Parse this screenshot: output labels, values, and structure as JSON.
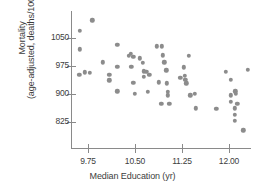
{
  "chart_data": {
    "type": "scatter",
    "title": "",
    "xlabel": "Median Education (yr)",
    "ylabel_line1": "Mortality",
    "ylabel_line2": "(age-adjusted, deaths/100 000)",
    "ylabel": "Mortality (age-adjusted, deaths/100 000)",
    "xticks": [
      "9.75",
      "10.50",
      "11.25",
      "12.00"
    ],
    "xtick_values": [
      9.75,
      10.5,
      11.25,
      12.0
    ],
    "yticks": [
      "1050",
      "975",
      "900",
      "825"
    ],
    "ytick_values": [
      1050,
      975,
      900,
      825
    ],
    "xlim": [
      9.5,
      12.4
    ],
    "ylim": [
      790,
      1110
    ],
    "grid": false,
    "legend": null,
    "marker_color": "#8c8c8c",
    "axis_color": "#8a8a8a",
    "text_color": "#3d3d3d",
    "points": [
      {
        "x": 9.82,
        "y": 1097
      },
      {
        "x": 9.62,
        "y": 1070
      },
      {
        "x": 9.62,
        "y": 1020
      },
      {
        "x": 9.61,
        "y": 952
      },
      {
        "x": 9.7,
        "y": 958
      },
      {
        "x": 9.78,
        "y": 956
      },
      {
        "x": 9.99,
        "y": 985
      },
      {
        "x": 10.09,
        "y": 951
      },
      {
        "x": 10.09,
        "y": 937
      },
      {
        "x": 10.22,
        "y": 1031
      },
      {
        "x": 10.22,
        "y": 973
      },
      {
        "x": 10.22,
        "y": 907
      },
      {
        "x": 10.4,
        "y": 1002
      },
      {
        "x": 10.43,
        "y": 1008
      },
      {
        "x": 10.44,
        "y": 973
      },
      {
        "x": 10.47,
        "y": 999
      },
      {
        "x": 10.47,
        "y": 930
      },
      {
        "x": 10.5,
        "y": 901
      },
      {
        "x": 10.58,
        "y": 996
      },
      {
        "x": 10.62,
        "y": 984
      },
      {
        "x": 10.64,
        "y": 961
      },
      {
        "x": 10.64,
        "y": 946
      },
      {
        "x": 10.68,
        "y": 959
      },
      {
        "x": 10.7,
        "y": 906
      },
      {
        "x": 10.73,
        "y": 951
      },
      {
        "x": 10.85,
        "y": 1028
      },
      {
        "x": 10.93,
        "y": 1028
      },
      {
        "x": 10.88,
        "y": 931
      },
      {
        "x": 10.92,
        "y": 873
      },
      {
        "x": 10.94,
        "y": 1004
      },
      {
        "x": 10.97,
        "y": 985
      },
      {
        "x": 11.0,
        "y": 963
      },
      {
        "x": 11.01,
        "y": 929
      },
      {
        "x": 11.02,
        "y": 906
      },
      {
        "x": 11.02,
        "y": 896
      },
      {
        "x": 11.05,
        "y": 873
      },
      {
        "x": 11.22,
        "y": 944
      },
      {
        "x": 11.28,
        "y": 972
      },
      {
        "x": 11.29,
        "y": 948
      },
      {
        "x": 11.3,
        "y": 938
      },
      {
        "x": 11.32,
        "y": 929
      },
      {
        "x": 11.36,
        "y": 1003
      },
      {
        "x": 11.38,
        "y": 897
      },
      {
        "x": 11.45,
        "y": 901
      },
      {
        "x": 11.47,
        "y": 862
      },
      {
        "x": 11.8,
        "y": 861
      },
      {
        "x": 11.95,
        "y": 959
      },
      {
        "x": 12.03,
        "y": 938
      },
      {
        "x": 12.03,
        "y": 897
      },
      {
        "x": 12.03,
        "y": 879
      },
      {
        "x": 12.1,
        "y": 907
      },
      {
        "x": 12.11,
        "y": 900
      },
      {
        "x": 12.09,
        "y": 862
      },
      {
        "x": 12.09,
        "y": 845
      },
      {
        "x": 12.09,
        "y": 828
      },
      {
        "x": 12.13,
        "y": 873
      },
      {
        "x": 12.23,
        "y": 803
      },
      {
        "x": 12.3,
        "y": 965
      }
    ]
  }
}
